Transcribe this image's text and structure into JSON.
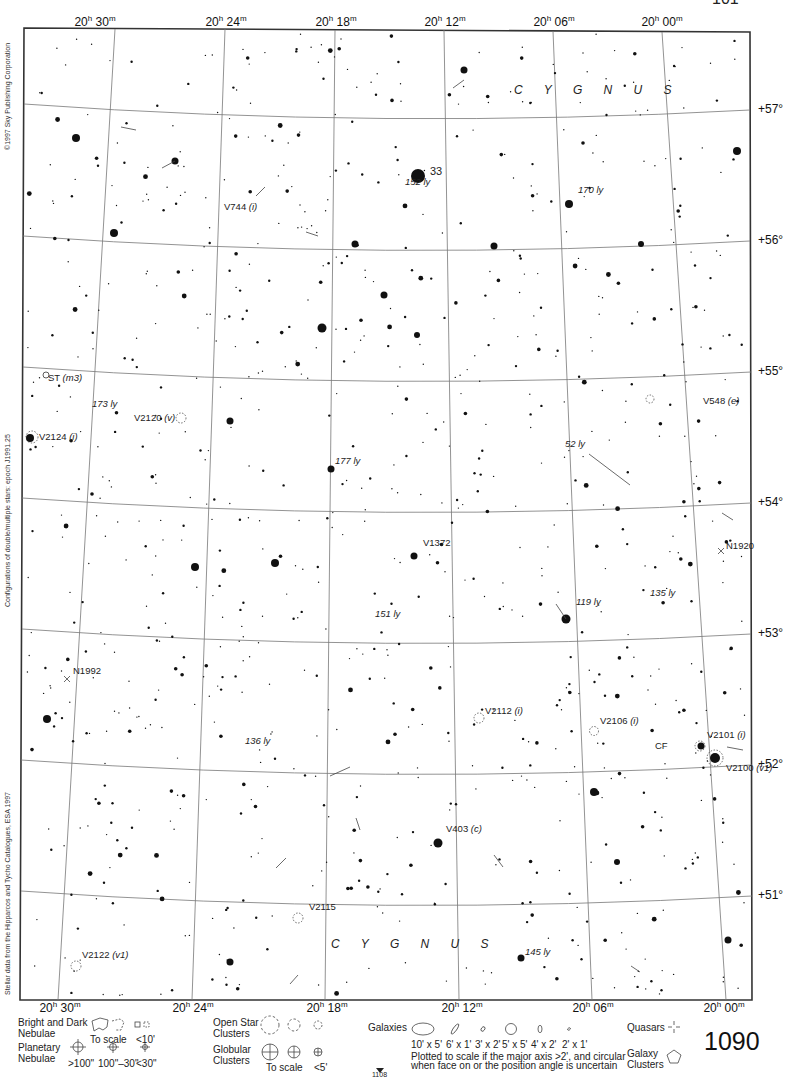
{
  "page": {
    "page_number": "1090",
    "adjacent_page_ref": "1108",
    "corner_number_partial": "101"
  },
  "constellation": {
    "name_top": "C Y G N U S",
    "name_bottom": "C Y G N U S"
  },
  "credits": {
    "copyright": "©1997 Sky Publishing Corporation",
    "double_stars": "Configurations of double/multiple stars: epoch J1991.25",
    "stellar_data": "Stellar data from the Hipparcos and Tycho Catalogues, ESA 1997"
  },
  "axes": {
    "ra_top": [
      {
        "h": "20",
        "m": "30",
        "x": 95
      },
      {
        "h": "20",
        "m": "24",
        "x": 226
      },
      {
        "h": "20",
        "m": "18",
        "x": 336
      },
      {
        "h": "20",
        "m": "12",
        "x": 445
      },
      {
        "h": "20",
        "m": "06",
        "x": 554
      },
      {
        "h": "20",
        "m": "00",
        "x": 662
      }
    ],
    "ra_bottom": [
      {
        "h": "20",
        "m": "30",
        "x": 60
      },
      {
        "h": "20",
        "m": "24",
        "x": 193
      },
      {
        "h": "20",
        "m": "18",
        "x": 327
      },
      {
        "h": "20",
        "m": "12",
        "x": 462
      },
      {
        "h": "20",
        "m": "06",
        "x": 593
      },
      {
        "h": "20",
        "m": "00",
        "x": 724
      }
    ],
    "dec": [
      {
        "label": "+57°",
        "y": 110
      },
      {
        "label": "+56°",
        "y": 241
      },
      {
        "label": "+55°",
        "y": 372
      },
      {
        "label": "+54°",
        "y": 503
      },
      {
        "label": "+53°",
        "y": 634
      },
      {
        "label": "+52°",
        "y": 765
      },
      {
        "label": "+51°",
        "y": 896
      }
    ]
  },
  "labels": {
    "objects": [
      {
        "id": "star-33",
        "text": "33",
        "x": 430,
        "y": 171
      },
      {
        "id": "V744",
        "text": "V744",
        "suffix": "(i)",
        "x": 224,
        "y": 207
      },
      {
        "id": "ST",
        "text": "ST",
        "suffix": "(m3)",
        "x": 48,
        "y": 378
      },
      {
        "id": "V2120",
        "text": "V2120",
        "suffix": "(v)",
        "x": 134,
        "y": 418
      },
      {
        "id": "V2124",
        "text": "V2124",
        "suffix": "(i)",
        "x": 39,
        "y": 437
      },
      {
        "id": "V548",
        "text": "V548",
        "suffix": "(e)",
        "x": 703,
        "y": 401
      },
      {
        "id": "V1372",
        "text": "V1372",
        "x": 423,
        "y": 543
      },
      {
        "id": "N1920",
        "text": "N1920",
        "x": 726,
        "y": 546
      },
      {
        "id": "N1992",
        "text": "N1992",
        "x": 73,
        "y": 671
      },
      {
        "id": "V2112",
        "text": "V2112",
        "suffix": "(i)",
        "x": 485,
        "y": 711
      },
      {
        "id": "V2106",
        "text": "V2106",
        "suffix": "(i)",
        "x": 600,
        "y": 721
      },
      {
        "id": "V2101",
        "text": "V2101",
        "suffix": "(i)",
        "x": 707,
        "y": 735
      },
      {
        "id": "CF",
        "text": "CF",
        "x": 655,
        "y": 746
      },
      {
        "id": "V2100",
        "text": "V2100",
        "suffix": "(v1)",
        "x": 726,
        "y": 768
      },
      {
        "id": "V403",
        "text": "V403",
        "suffix": "(c)",
        "x": 446,
        "y": 829
      },
      {
        "id": "V2115",
        "text": "V2115",
        "x": 309,
        "y": 907
      },
      {
        "id": "V2122",
        "text": "V2122",
        "suffix": "(v1)",
        "x": 82,
        "y": 955
      }
    ],
    "distances": [
      {
        "text": "152 ly",
        "x": 405,
        "y": 182
      },
      {
        "text": "170 ly",
        "x": 578,
        "y": 190
      },
      {
        "text": "173 ly",
        "x": 92,
        "y": 404
      },
      {
        "text": "177 ly",
        "x": 335,
        "y": 461
      },
      {
        "text": "52 ly",
        "x": 565,
        "y": 444
      },
      {
        "text": "119 ly",
        "x": 576,
        "y": 602
      },
      {
        "text": "135 ly",
        "x": 650,
        "y": 593
      },
      {
        "text": "151 ly",
        "x": 375,
        "y": 614
      },
      {
        "text": "136 ly",
        "x": 245,
        "y": 741
      },
      {
        "text": "145 ly",
        "x": 525,
        "y": 952
      }
    ]
  },
  "legend": {
    "nebulae": {
      "title_line1": "Bright and Dark",
      "title_line2": "Nebulae",
      "scale": "To scale",
      "small": "<10'"
    },
    "planetary": {
      "title_line1": "Planetary",
      "title_line2": "Nebulae",
      "sizes": [
        ">100\"",
        "100\"–30\"",
        "<30\""
      ]
    },
    "open_clusters": {
      "title_line1": "Open Star",
      "title_line2": "Clusters"
    },
    "globular": {
      "title_line1": "Globular",
      "title_line2": "Clusters",
      "scale": "To scale",
      "small": "<5'"
    },
    "galaxies": {
      "title": "Galaxies",
      "sizes": [
        "10' x 5'",
        "6' x 1'",
        "3' x 2'",
        "5' x 5'",
        "4' x 2'",
        "2' x 1'"
      ],
      "note_line1": "Plotted to scale if the major axis >2', and circular",
      "note_line2": "when face on or the position angle is uncertain"
    },
    "quasars": {
      "title": "Quasars"
    },
    "galaxy_clusters": {
      "title_line1": "Galaxy",
      "title_line2": "Clusters"
    }
  },
  "chart_data": {
    "type": "scatter",
    "xlabel": "Right Ascension",
    "ylabel": "Declination",
    "x_ticks": [
      "20h 30m",
      "20h 24m",
      "20h 18m",
      "20h 12m",
      "20h 06m",
      "20h 00m"
    ],
    "y_ticks": [
      "+51°",
      "+52°",
      "+53°",
      "+54°",
      "+55°",
      "+56°",
      "+57°"
    ],
    "grid": true,
    "bright_stars": [
      {
        "x": 418,
        "y": 176,
        "r": 7,
        "label": "33"
      },
      {
        "x": 322,
        "y": 328,
        "r": 4.5
      },
      {
        "x": 76,
        "y": 138,
        "r": 4
      },
      {
        "x": 175,
        "y": 161,
        "r": 3.5
      },
      {
        "x": 114,
        "y": 233,
        "r": 4
      },
      {
        "x": 737,
        "y": 151,
        "r": 4
      },
      {
        "x": 569,
        "y": 204,
        "r": 4
      },
      {
        "x": 384,
        "y": 295,
        "r": 3.5
      },
      {
        "x": 417,
        "y": 335,
        "r": 3
      },
      {
        "x": 30,
        "y": 438,
        "r": 4
      },
      {
        "x": 230,
        "y": 421,
        "r": 3.5
      },
      {
        "x": 331,
        "y": 469,
        "r": 3.5
      },
      {
        "x": 275,
        "y": 563,
        "r": 4
      },
      {
        "x": 195,
        "y": 567,
        "r": 4
      },
      {
        "x": 414,
        "y": 556,
        "r": 3.5
      },
      {
        "x": 566,
        "y": 619,
        "r": 4.5
      },
      {
        "x": 47,
        "y": 719,
        "r": 4
      },
      {
        "x": 715,
        "y": 758,
        "r": 5
      },
      {
        "x": 701,
        "y": 746,
        "r": 3.5
      },
      {
        "x": 438,
        "y": 843,
        "r": 4.5
      },
      {
        "x": 594,
        "y": 792,
        "r": 4
      },
      {
        "x": 230,
        "y": 962,
        "r": 3.5
      },
      {
        "x": 521,
        "y": 958,
        "r": 3.5
      },
      {
        "x": 728,
        "y": 940,
        "r": 3.5
      },
      {
        "x": 617,
        "y": 862,
        "r": 3
      },
      {
        "x": 355,
        "y": 244,
        "r": 3.5
      },
      {
        "x": 494,
        "y": 246,
        "r": 3.5
      },
      {
        "x": 464,
        "y": 70,
        "r": 3.5
      },
      {
        "x": 641,
        "y": 244,
        "r": 3
      }
    ]
  }
}
